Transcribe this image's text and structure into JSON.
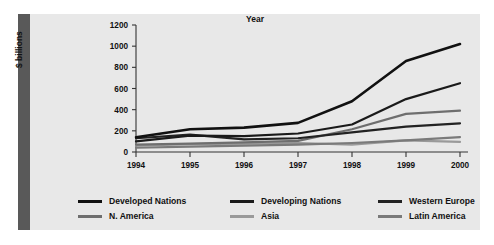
{
  "figure": {
    "background_color": "#e8e8e8",
    "spine_color": "#595959"
  },
  "chart_data": {
    "type": "line",
    "title": "",
    "xlabel": "Year",
    "ylabel": "$ billions",
    "categories": [
      "1994",
      "1995",
      "1996",
      "1997",
      "1998",
      "1999",
      "2000"
    ],
    "x": [
      1994,
      1995,
      1996,
      1997,
      1998,
      1999,
      2000
    ],
    "xlim": [
      1994,
      2000
    ],
    "ylim": [
      0,
      1200
    ],
    "yticks": [
      0,
      200,
      400,
      600,
      800,
      1000,
      1200
    ],
    "ytick_labels": [
      "0",
      "200",
      "400",
      "600",
      "800",
      "1000",
      "1200"
    ],
    "grid": false,
    "legend_position": "below",
    "series": [
      {
        "name": "Developed Nations",
        "color": "#111111",
        "width": 2.6,
        "values": [
          140,
          215,
          230,
          275,
          480,
          860,
          1020
        ]
      },
      {
        "name": "Developing Nations",
        "color": "#1a1a1a",
        "width": 2.2,
        "values": [
          100,
          155,
          150,
          175,
          260,
          500,
          650
        ]
      },
      {
        "name": "Western Europe",
        "color": "#222222",
        "width": 2.2,
        "values": [
          130,
          165,
          120,
          130,
          185,
          240,
          270
        ]
      },
      {
        "name": "N. America",
        "color": "#6e6e6e",
        "width": 2.2,
        "values": [
          70,
          80,
          90,
          105,
          215,
          360,
          390
        ]
      },
      {
        "name": "Asia",
        "color": "#9a9a9a",
        "width": 2.2,
        "values": [
          60,
          75,
          80,
          85,
          70,
          110,
          95
        ]
      },
      {
        "name": "Latin America",
        "color": "#7a7a7a",
        "width": 2.2,
        "values": [
          40,
          50,
          60,
          70,
          85,
          110,
          140
        ]
      }
    ]
  },
  "legend": {
    "rows": [
      [
        {
          "label": "Developed Nations",
          "color": "#111111"
        },
        {
          "label": "Developing Nations",
          "color": "#1a1a1a"
        },
        {
          "label": "Western Europe",
          "color": "#222222"
        }
      ],
      [
        {
          "label": "N. America",
          "color": "#6e6e6e"
        },
        {
          "label": "Asia",
          "color": "#9a9a9a"
        },
        {
          "label": "Latin America",
          "color": "#7a7a7a"
        }
      ]
    ]
  }
}
